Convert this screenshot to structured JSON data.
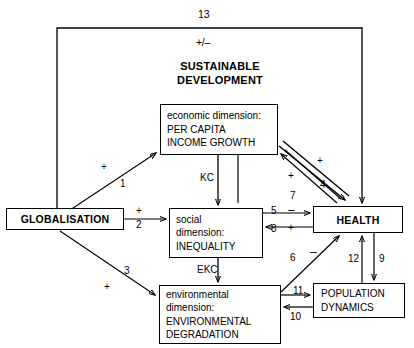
{
  "diagram": {
    "title": "SUSTAINABLE DEVELOPMENT",
    "title_line1": "SUSTAINABLE",
    "title_line2": "DEVELOPMENT",
    "outer_link_number": "13",
    "outer_link_sign": "+/–"
  },
  "nodes": {
    "globalisation": {
      "label": "GLOBALISATION"
    },
    "economic": {
      "line1": "economic dimension:",
      "line2": "PER CAPITA",
      "line3": "INCOME GROWTH"
    },
    "social": {
      "line1": "social",
      "line2": "dimension:",
      "line3": "INEQUALITY"
    },
    "environmental": {
      "line1": "environmental",
      "line2": "dimension:",
      "line3": "ENVIRONMENTAL",
      "line4": "DEGRADATION"
    },
    "health": {
      "label": "HEALTH"
    },
    "population": {
      "line1": "POPULATION",
      "line2": "DYNAMICS"
    }
  },
  "edge_labels": {
    "kc": "KC",
    "ekc": "EKC",
    "n1": "1",
    "s1": "+",
    "n2": "2",
    "s2": "+",
    "n3": "3",
    "s3": "+",
    "n4": "4",
    "s4": "+",
    "n5": "5",
    "s5": "–",
    "n6": "6",
    "s6": "–",
    "n7": "7",
    "s7": "+",
    "n8": "8",
    "s8": "+",
    "n9": "9",
    "n10": "10",
    "n11": "11",
    "n12": "12",
    "n13": "13",
    "s13": "+/–"
  },
  "colors": {
    "stroke": "#000000",
    "background": "#ffffff",
    "text": "#000000"
  }
}
